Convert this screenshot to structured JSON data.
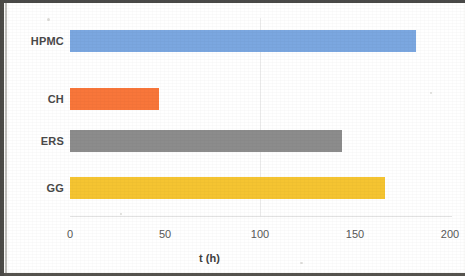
{
  "chart_data": {
    "type": "bar",
    "orientation": "horizontal",
    "title": "",
    "xlabel": "t (h)",
    "ylabel": "",
    "categories": [
      "HPMC",
      "CH",
      "ERS",
      "GG"
    ],
    "values": [
      182,
      47,
      143,
      166
    ],
    "series": [
      {
        "name": "t (h)",
        "values": [
          182,
          47,
          143,
          166
        ]
      }
    ],
    "bars": [
      {
        "category": "HPMC",
        "value": 182,
        "color": "#7BA7E0"
      },
      {
        "category": "CH",
        "value": 47,
        "color": "#F8763A"
      },
      {
        "category": "ERS",
        "value": 143,
        "color": "#8C8C8C"
      },
      {
        "category": "GG",
        "value": 166,
        "color": "#F5C431"
      }
    ],
    "xlim": [
      0,
      200
    ],
    "xticks": [
      0,
      50,
      100,
      150,
      200
    ],
    "xtick_labels": [
      "0",
      "50",
      "100",
      "150",
      "200"
    ],
    "grid": false,
    "legend": "none"
  },
  "axis": {
    "tick_0": "0",
    "tick_1": "50",
    "tick_2": "100",
    "tick_3": "150",
    "tick_4": "200",
    "x_title": "t (h)"
  },
  "labels": {
    "cat_0": "HPMC",
    "cat_1": "CH",
    "cat_2": "ERS",
    "cat_3": "GG"
  },
  "colors": {
    "hpmc": "#7BA7E0",
    "ch": "#F8763A",
    "ers": "#8C8C8C",
    "gg": "#F5C431",
    "axis_text": "#585858",
    "category_text": "#4a4a4a"
  }
}
